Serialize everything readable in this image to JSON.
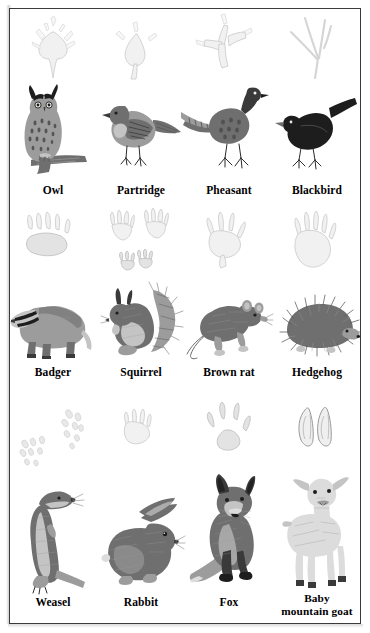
{
  "page": {
    "background_color": "#ffffff",
    "border_color": "#3a3a3a"
  },
  "rows": [
    {
      "row_name": "birds",
      "cells": [
        {
          "label": "Owl",
          "animal_icon": "owl-illustration",
          "track_icon": "owl-track"
        },
        {
          "label": "Partridge",
          "animal_icon": "partridge-illustration",
          "track_icon": "partridge-track"
        },
        {
          "label": "Pheasant",
          "animal_icon": "pheasant-illustration",
          "track_icon": "pheasant-track"
        },
        {
          "label": "Blackbird",
          "animal_icon": "blackbird-illustration",
          "track_icon": "blackbird-track"
        }
      ]
    },
    {
      "row_name": "small-mammals",
      "cells": [
        {
          "label": "Badger",
          "animal_icon": "badger-illustration",
          "track_icon": "badger-track"
        },
        {
          "label": "Squirrel",
          "animal_icon": "squirrel-illustration",
          "track_icon": "squirrel-track"
        },
        {
          "label": "Brown rat",
          "animal_icon": "brown-rat-illustration",
          "track_icon": "brown-rat-track"
        },
        {
          "label": "Hedgehog",
          "animal_icon": "hedgehog-illustration",
          "track_icon": "hedgehog-track"
        }
      ]
    },
    {
      "row_name": "larger-mammals",
      "cells": [
        {
          "label": "Weasel",
          "animal_icon": "weasel-illustration",
          "track_icon": "weasel-track"
        },
        {
          "label": "Rabbit",
          "animal_icon": "rabbit-illustration",
          "track_icon": "rabbit-track"
        },
        {
          "label": "Fox",
          "animal_icon": "fox-illustration",
          "track_icon": "fox-track"
        },
        {
          "label_line1": "Baby",
          "label_line2": "mountain goat",
          "animal_icon": "baby-mountain-goat-illustration",
          "track_icon": "baby-mountain-goat-track"
        }
      ]
    }
  ]
}
